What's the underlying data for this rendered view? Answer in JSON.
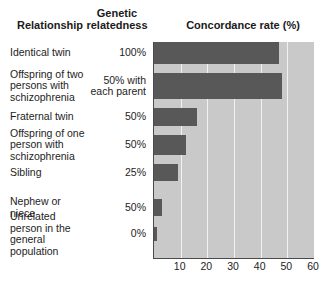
{
  "headers": {
    "relationship": "Relationship",
    "genetic_relatedness_line1": "Genetic",
    "genetic_relatedness_line2": "relatedness",
    "concordance": "Concordance rate (%)"
  },
  "colors": {
    "bar": "#585858",
    "plot_background": "#c9c9c9",
    "gridline": "#f2f2f2",
    "axis": "#4a4a4a",
    "text": "#1d1d1d"
  },
  "rows": [
    {
      "relationship": "Identical twin",
      "genetic": "100%",
      "concordance": 47
    },
    {
      "relationship": "Offspring of two persons with schizophrenia",
      "genetic": "50% with each parent",
      "concordance": 48
    },
    {
      "relationship": "Fraternal twin",
      "genetic": "50%",
      "concordance": 16
    },
    {
      "relationship": "Offspring of one person with schizophrenia",
      "genetic": "50%",
      "concordance": 12
    },
    {
      "relationship": "Sibling",
      "genetic": "25%",
      "concordance": 9
    },
    {
      "relationship": "Nephew or niece",
      "genetic": "50%",
      "concordance": 3
    },
    {
      "relationship": "Unrelated person in the general population",
      "genetic": "0%",
      "concordance": 1
    }
  ],
  "chart_data": {
    "type": "bar",
    "orientation": "horizontal",
    "title": "Concordance rate (%)",
    "xlabel": "Concordance rate (%)",
    "ylabel": "Relationship",
    "xlim": [
      0,
      60
    ],
    "xticks": [
      10,
      20,
      30,
      40,
      50,
      60
    ],
    "grid": true,
    "legend": null,
    "categories": [
      "Identical twin",
      "Offspring of two persons with schizophrenia",
      "Fraternal twin",
      "Offspring of one person with schizophrenia",
      "Sibling",
      "Nephew or niece",
      "Unrelated person in the general population"
    ],
    "values": [
      47,
      48,
      16,
      12,
      9,
      3,
      1
    ],
    "genetic_relatedness": [
      "100%",
      "50% with each parent",
      "50%",
      "50%",
      "25%",
      "50%",
      "0%"
    ]
  }
}
